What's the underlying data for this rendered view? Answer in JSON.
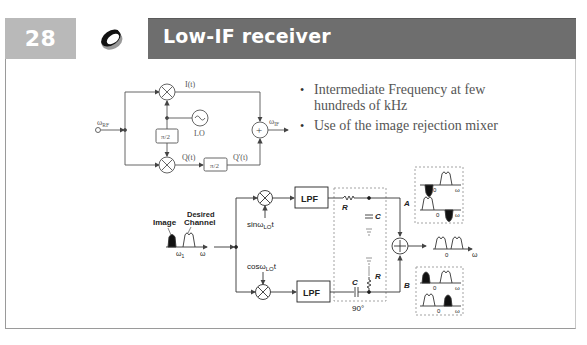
{
  "slide": {
    "number": "28",
    "title": "Low-IF receiver",
    "logo": "ring-logo-icon"
  },
  "bullets": [
    {
      "text": "Intermediate Frequency at few hundreds of kHz"
    },
    {
      "text": "Use of the image rejection mixer"
    }
  ],
  "top_diagram": {
    "input_label": "ω",
    "input_sub": "RF",
    "output_label": "ω",
    "output_sub": "IF",
    "i_label": "I(t)",
    "q_label": "Q(t)",
    "q_prime_label": "Q'(t)",
    "phase_shift_1": "π/2",
    "phase_shift_2": "π/2",
    "lo_label": "LO",
    "summer_symbol": "+"
  },
  "bottom_diagram": {
    "image_label": "Image",
    "desired_label_1": "Desired",
    "desired_label_2": "Channel",
    "omega1_label": "ω",
    "omega1_sub": "1",
    "omega_axis": "ω",
    "sin_label": "sinω",
    "sin_sub": "LO",
    "sin_t": "t",
    "cos_label": "cosω",
    "cos_sub": "LO",
    "cos_t": "t",
    "lpf_top": "LPF",
    "lpf_bottom": "LPF",
    "r_top": "R",
    "c_top": "C",
    "c_bottom": "C",
    "r_bottom": "R",
    "phase_label": "90°",
    "branch_a": "A",
    "branch_b": "B",
    "zero": "0",
    "omega": "ω"
  },
  "colors": {
    "title_bar": "#6e6e6e",
    "number_box": "#b9b9b9",
    "diagram_line": "#555555",
    "bullet_text": "#555555"
  }
}
